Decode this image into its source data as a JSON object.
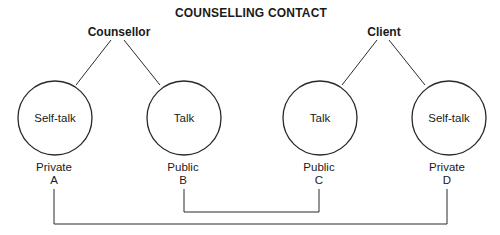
{
  "title": "COUNSELLING CONTACT",
  "parties": {
    "counsellor": {
      "label": "Counsellor",
      "nodes": [
        {
          "label": "Self-talk",
          "type": "Private",
          "letter": "A"
        },
        {
          "label": "Talk",
          "type": "Public",
          "letter": "B"
        }
      ]
    },
    "client": {
      "label": "Client",
      "nodes": [
        {
          "label": "Talk",
          "type": "Public",
          "letter": "C"
        },
        {
          "label": "Self-talk",
          "type": "Private",
          "letter": "D"
        }
      ]
    }
  },
  "connections": [
    {
      "from": "B",
      "to": "C",
      "description": "Public to Public"
    },
    {
      "from": "A",
      "to": "D",
      "description": "Private to Private"
    }
  ],
  "colors": {
    "line": "#2a2a2a",
    "text": "#1a1a1a",
    "background": "#ffffff"
  }
}
